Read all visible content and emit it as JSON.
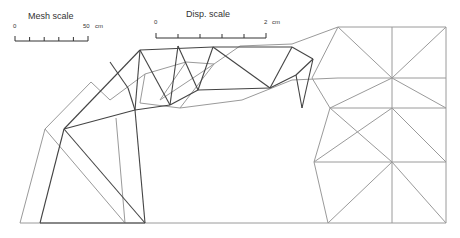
{
  "mesh_scale": {
    "title": "Mesh scale",
    "start_label": "0",
    "end_label": "50",
    "unit": "cm",
    "ticks": 6
  },
  "disp_scale": {
    "title": "Disp. scale",
    "start_label": "0",
    "end_label": "2",
    "unit": "cm",
    "ticks": 6
  },
  "colors": {
    "undeformed": "#9a9a9a",
    "deformed": "#444444",
    "background": "#ffffff"
  },
  "mesh": {
    "undeformed_lines": [
      [
        20,
        223,
        328,
        223
      ],
      [
        20,
        223,
        45,
        129
      ],
      [
        45,
        129,
        91,
        82
      ],
      [
        91,
        82,
        110,
        100
      ],
      [
        45,
        129,
        125,
        223
      ],
      [
        125,
        223,
        116,
        118
      ],
      [
        110,
        100,
        145,
        74
      ],
      [
        145,
        74,
        186,
        62
      ],
      [
        186,
        62,
        214,
        64
      ],
      [
        214,
        64,
        240,
        46
      ],
      [
        240,
        46,
        292,
        44
      ],
      [
        292,
        44,
        338,
        27
      ],
      [
        140,
        103,
        145,
        74
      ],
      [
        140,
        103,
        180,
        108
      ],
      [
        180,
        108,
        214,
        64
      ],
      [
        180,
        108,
        242,
        100
      ],
      [
        242,
        100,
        292,
        80
      ],
      [
        292,
        80,
        338,
        78
      ],
      [
        338,
        27,
        446,
        27
      ],
      [
        338,
        27,
        392,
        78
      ],
      [
        392,
        78,
        446,
        27
      ],
      [
        338,
        78,
        446,
        78
      ],
      [
        392,
        27,
        392,
        223
      ],
      [
        446,
        27,
        446,
        223
      ],
      [
        392,
        78,
        446,
        108
      ],
      [
        330,
        108,
        446,
        108
      ],
      [
        330,
        108,
        392,
        78
      ],
      [
        330,
        108,
        392,
        162
      ],
      [
        392,
        108,
        314,
        162
      ],
      [
        392,
        108,
        446,
        162
      ],
      [
        314,
        162,
        446,
        162
      ],
      [
        314,
        162,
        328,
        223
      ],
      [
        392,
        162,
        328,
        223
      ],
      [
        392,
        162,
        446,
        223
      ],
      [
        328,
        223,
        446,
        223
      ],
      [
        330,
        108,
        314,
        162
      ],
      [
        338,
        27,
        312,
        78
      ],
      [
        312,
        78,
        330,
        108
      ],
      [
        160,
        100,
        186,
        62
      ],
      [
        160,
        100,
        214,
        64
      ]
    ],
    "deformed_lines": [
      [
        40,
        223,
        145,
        223
      ],
      [
        40,
        223,
        64,
        129
      ],
      [
        64,
        129,
        140,
        50
      ],
      [
        140,
        50,
        213,
        47
      ],
      [
        213,
        47,
        292,
        47
      ],
      [
        292,
        47,
        313,
        59
      ],
      [
        64,
        129,
        145,
        223
      ],
      [
        145,
        223,
        135,
        110
      ],
      [
        64,
        129,
        135,
        110
      ],
      [
        135,
        110,
        170,
        105
      ],
      [
        170,
        105,
        198,
        90
      ],
      [
        198,
        90,
        270,
        88
      ],
      [
        270,
        88,
        296,
        75
      ],
      [
        296,
        75,
        313,
        59
      ],
      [
        140,
        50,
        135,
        110
      ],
      [
        140,
        50,
        170,
        105
      ],
      [
        178,
        46,
        170,
        105
      ],
      [
        178,
        46,
        198,
        90
      ],
      [
        213,
        47,
        198,
        90
      ],
      [
        213,
        47,
        270,
        88
      ],
      [
        292,
        47,
        270,
        88
      ],
      [
        296,
        75,
        302,
        108
      ],
      [
        313,
        59,
        302,
        108
      ],
      [
        110,
        62,
        128,
        88
      ],
      [
        128,
        88,
        135,
        110
      ]
    ]
  }
}
